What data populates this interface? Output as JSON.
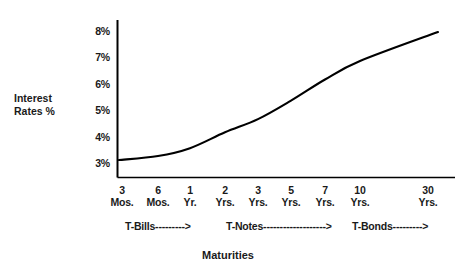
{
  "chart_data": {
    "type": "line",
    "title": "",
    "subtitle": "",
    "xlabel": "Maturities",
    "ylabel": "Interest Rates %",
    "categories": [
      "3 Mos.",
      "6 Mos.",
      "1 Yr.",
      "2 Yrs.",
      "3 Yrs.",
      "5 Yrs.",
      "7 Yrs.",
      "10 Yrs.",
      "30 Yrs."
    ],
    "values": [
      3.15,
      3.3,
      3.6,
      4.2,
      4.7,
      5.4,
      6.2,
      6.9,
      8.0
    ],
    "series": [
      {
        "name": "Yield Curve",
        "values": [
          3.15,
          3.3,
          3.6,
          4.2,
          4.7,
          5.4,
          6.2,
          6.9,
          8.0
        ]
      }
    ],
    "ylim": [
      3,
      8
    ],
    "ytick_labels": [
      "3%",
      "4%",
      "5%",
      "6%",
      "7%",
      "8%"
    ],
    "ytick_values": [
      3,
      4,
      5,
      6,
      7,
      8
    ],
    "grid": false,
    "legend": "none",
    "line_color": "#000000",
    "axis_color": "#000000",
    "background": "#ffffff"
  },
  "axes": {
    "y_title_line1": "Interest",
    "y_title_line2": "Rates %",
    "x_title": "Maturities"
  },
  "x_ticks": [
    {
      "num": "3",
      "unit": "Mos."
    },
    {
      "num": "6",
      "unit": "Mos."
    },
    {
      "num": "1",
      "unit": "Yr."
    },
    {
      "num": "2",
      "unit": "Yrs."
    },
    {
      "num": "3",
      "unit": "Yrs."
    },
    {
      "num": "5",
      "unit": "Yrs."
    },
    {
      "num": "7",
      "unit": "Yrs."
    },
    {
      "num": "10",
      "unit": "Yrs."
    },
    {
      "num": "30",
      "unit": "Yrs."
    }
  ],
  "y_ticks": [
    {
      "label": "8%"
    },
    {
      "label": "7%"
    },
    {
      "label": "6%"
    },
    {
      "label": "5%"
    },
    {
      "label": "4%"
    },
    {
      "label": "3%"
    }
  ],
  "security_groups": [
    {
      "label": "T-Bills--------->"
    },
    {
      "label": "T-Notes------------------->"
    },
    {
      "label": "T-Bonds--------->"
    }
  ]
}
